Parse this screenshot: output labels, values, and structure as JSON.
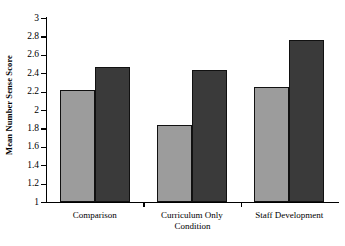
{
  "chart_data": {
    "type": "bar",
    "title": "",
    "xlabel": "Condition",
    "ylabel": "Mean Number Sense Score",
    "categories": [
      "Comparison",
      "Curriculum Only",
      "Staff Development"
    ],
    "series": [
      {
        "name": "series-1",
        "color": "#9c9c9c",
        "values": [
          2.22,
          1.84,
          2.25
        ]
      },
      {
        "name": "series-2",
        "color": "#3a3a3a",
        "values": [
          2.47,
          2.44,
          2.76
        ]
      }
    ],
    "ylim": [
      1,
      3
    ],
    "ytick_step": 0.2,
    "yticks": [
      "1",
      "1.2",
      "1.4",
      "1.6",
      "1.8",
      "2",
      "2.2",
      "2.4",
      "2.6",
      "2.8",
      "3"
    ],
    "grid": false,
    "legend": "none"
  }
}
